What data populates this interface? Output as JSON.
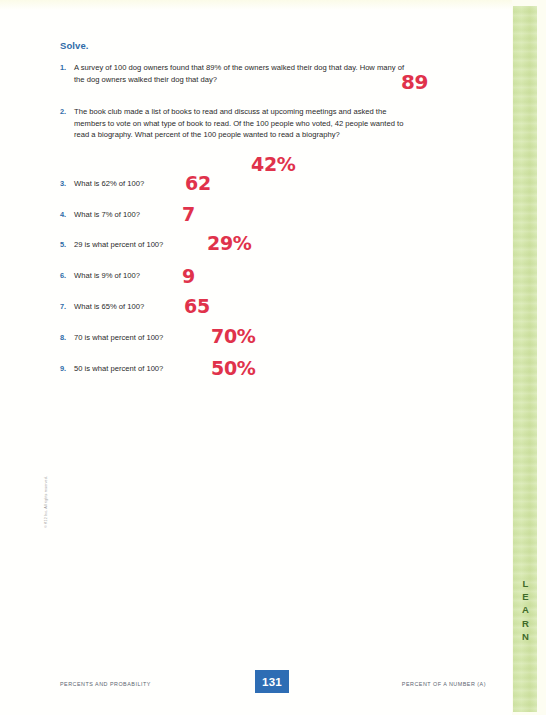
{
  "page": {
    "heading": "Solve.",
    "copyright": "© K12 Inc. All rights reserved.",
    "side_tab_label": "LEARN",
    "accent_blue": "#2f6ca8",
    "answer_red": "#e0324b",
    "strip_green": "#d3e5a8",
    "badge_blue": "#2e6db4"
  },
  "questions": [
    {
      "number": "1.",
      "text": "A survey of 100 dog owners found that 89% of the owners walked their dog that day. How many of the dog owners walked their dog that day?",
      "answer": "89"
    },
    {
      "number": "2.",
      "text": "The book club made a list of books to read and discuss at upcoming meetings and asked the members to vote on what type of book to read. Of the 100 people who voted, 42 people wanted to read a biography. What percent of the 100 people wanted to read a biography?",
      "answer": "42%"
    },
    {
      "number": "3.",
      "text": "What is 62% of 100?",
      "answer": "62"
    },
    {
      "number": "4.",
      "text": "What is 7% of 100?",
      "answer": "7"
    },
    {
      "number": "5.",
      "text": "29 is what percent of 100?",
      "answer": "29%"
    },
    {
      "number": "6.",
      "text": "What is 9% of 100?",
      "answer": "9"
    },
    {
      "number": "7.",
      "text": "What is 65% of 100?",
      "answer": "65"
    },
    {
      "number": "8.",
      "text": "70 is what percent of 100?",
      "answer": "70%"
    },
    {
      "number": "9.",
      "text": "50 is what percent of 100?",
      "answer": "50%"
    }
  ],
  "footer": {
    "left": "PERCENTS AND PROBABILITY",
    "page_number": "131",
    "right": "PERCENT OF A NUMBER (A)"
  }
}
